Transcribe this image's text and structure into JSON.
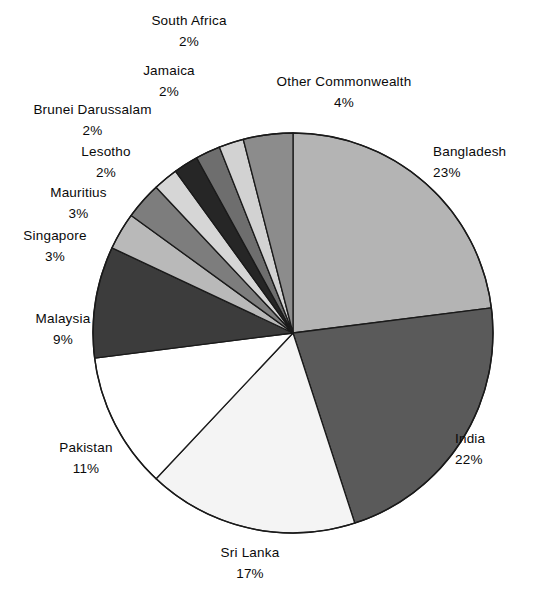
{
  "chart_data": {
    "type": "pie",
    "title": "",
    "subtitle": "",
    "xlabel": "",
    "ylabel": "",
    "grid": false,
    "legend_position": "callout-labels",
    "start_angle_deg": 0,
    "direction": "clockwise",
    "categories": [
      "Bangladesh",
      "India",
      "Sri Lanka",
      "Pakistan",
      "Malaysia",
      "Singapore",
      "Mauritius",
      "Lesotho",
      "Brunei Darussalam",
      "Jamaica",
      "South Africa",
      "Other Commonwealth"
    ],
    "values": [
      23,
      22,
      17,
      11,
      9,
      3,
      3,
      2,
      2,
      2,
      2,
      4
    ],
    "value_labels": [
      "23%",
      "22%",
      "17%",
      "11%",
      "9%",
      "3%",
      "3%",
      "2%",
      "2%",
      "2%",
      "2%",
      "4%"
    ],
    "unit": "%",
    "slice_colors": [
      "#b4b4b4",
      "#5a5a5a",
      "#f4f4f4",
      "#ffffff",
      "#3c3c3c",
      "#b9b9b9",
      "#7d7d7d",
      "#d6d6d6",
      "#262626",
      "#6e6e6e",
      "#d2d2d2",
      "#8c8c8c"
    ],
    "slice_stroke": "#1a1a1a"
  },
  "labels": [
    {
      "name": "South Africa",
      "value": "2%"
    },
    {
      "name": "Jamaica",
      "value": "2%"
    },
    {
      "name": "Brunei  Darussalam",
      "value": "2%"
    },
    {
      "name": "Lesotho",
      "value": "2%"
    },
    {
      "name": "Mauritius",
      "value": "3%"
    },
    {
      "name": "Singapore",
      "value": "3%"
    },
    {
      "name": "Malaysia",
      "value": "9%"
    },
    {
      "name": "Pakistan",
      "value": "11%"
    },
    {
      "name": "Sri  Lanka",
      "value": "17%"
    },
    {
      "name": "India",
      "value": "22%"
    },
    {
      "name": "Bangladesh",
      "value": "23%"
    },
    {
      "name": "Other  Commonwealth",
      "value": "4%"
    }
  ],
  "geometry": {
    "center_x": 293,
    "center_y": 333,
    "radius": 200
  }
}
